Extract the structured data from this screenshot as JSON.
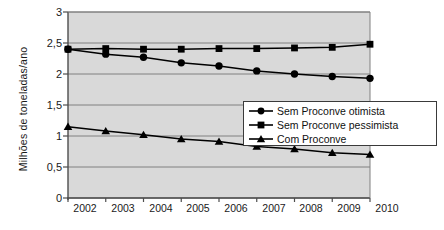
{
  "chart_data": {
    "type": "line",
    "title": "",
    "xlabel": "",
    "ylabel": "Milhões de toneladas/ano",
    "categories": [
      "2002",
      "2003",
      "2004",
      "2005",
      "2006",
      "2007",
      "2008",
      "2009",
      "2010"
    ],
    "x": [
      2002,
      2003,
      2004,
      2005,
      2006,
      2007,
      2008,
      2009,
      2010
    ],
    "ylim": [
      0,
      3
    ],
    "yticks": [
      "0",
      "0,5",
      "1",
      "1,5",
      "2",
      "2,5",
      "3"
    ],
    "ytick_values": [
      0,
      0.5,
      1,
      1.5,
      2,
      2.5,
      3
    ],
    "grid": true,
    "grid_axis": "y",
    "legend_position": "lower-right-inside",
    "plot_background": "#d9d9d9",
    "series": [
      {
        "name": "Sem Proconve otimista",
        "marker": "circle",
        "color": "#000000",
        "values": [
          2.4,
          2.32,
          2.27,
          2.18,
          2.13,
          2.05,
          2.0,
          1.96,
          1.93
        ]
      },
      {
        "name": "Sem Proconve pessimista",
        "marker": "square",
        "color": "#000000",
        "values": [
          2.4,
          2.41,
          2.4,
          2.4,
          2.41,
          2.41,
          2.42,
          2.43,
          2.48
        ]
      },
      {
        "name": "Com Proconve",
        "marker": "triangle",
        "color": "#000000",
        "values": [
          1.15,
          1.08,
          1.02,
          0.95,
          0.91,
          0.83,
          0.79,
          0.73,
          0.7
        ]
      }
    ]
  },
  "axes": {
    "y_title": "Milhões de toneladas/ano",
    "y_labels": [
      "3",
      "2,5",
      "2",
      "1,5",
      "1",
      "0,5",
      "0"
    ],
    "x_labels": [
      "2002",
      "2003",
      "2004",
      "2005",
      "2006",
      "2007",
      "2008",
      "2009",
      "2010"
    ]
  },
  "legend": {
    "items": [
      {
        "label": "Sem Proconve otimista",
        "marker": "circle"
      },
      {
        "label": "Sem Proconve pessimista",
        "marker": "square"
      },
      {
        "label": "Com Proconve",
        "marker": "triangle"
      }
    ]
  }
}
